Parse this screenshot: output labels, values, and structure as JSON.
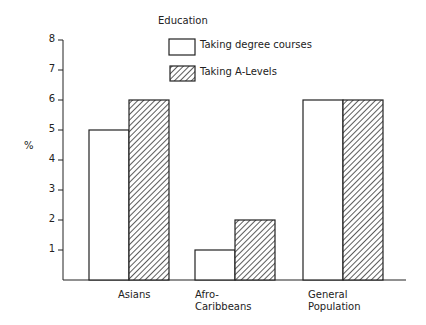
{
  "chart_data": {
    "type": "bar",
    "title": "Education",
    "xlabel": "",
    "ylabel": "%",
    "ylim": [
      0,
      8
    ],
    "yticks": [
      1,
      2,
      3,
      4,
      5,
      6,
      7,
      8
    ],
    "grid": false,
    "legend_position": "top-center",
    "categories": [
      "Asians",
      "Afro-Caribbeans",
      "General Population"
    ],
    "category_display": [
      [
        "Asians"
      ],
      [
        "Afro-",
        "Caribbeans"
      ],
      [
        "General",
        "Population"
      ]
    ],
    "series": [
      {
        "name": "Taking degree courses",
        "fill": "white",
        "values": [
          5,
          1,
          6
        ]
      },
      {
        "name": "Taking A-Levels",
        "fill": "hatched",
        "values": [
          6,
          2,
          6
        ]
      }
    ]
  },
  "colors": {
    "stroke": "#222222",
    "background": "#ffffff"
  }
}
